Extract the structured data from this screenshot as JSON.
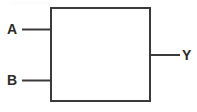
{
  "diagram": {
    "kind": "logic-block-symbol",
    "canvas": {
      "width": 197,
      "height": 112,
      "background": "#ffffff"
    },
    "stroke": {
      "color": "#3a3a3a",
      "width": 2
    },
    "block": {
      "name": "logic-block",
      "label": "",
      "x": 51,
      "y": 8,
      "width": 99,
      "height": 93,
      "fill": "#ffffff"
    },
    "ports": {
      "inputs": [
        {
          "id": "a",
          "label": "A",
          "label_x": 7,
          "label_y": 22,
          "wire": {
            "x1": 22,
            "y1": 29.5,
            "x2": 51,
            "y2": 29.5
          }
        },
        {
          "id": "b",
          "label": "B",
          "label_x": 7,
          "label_y": 73,
          "wire": {
            "x1": 22,
            "y1": 80.5,
            "x2": 51,
            "y2": 80.5
          }
        }
      ],
      "outputs": [
        {
          "id": "y",
          "label": "Y",
          "label_x": 182,
          "label_y": 48,
          "wire": {
            "x1": 150,
            "y1": 55,
            "x2": 180,
            "y2": 55
          }
        }
      ]
    }
  }
}
